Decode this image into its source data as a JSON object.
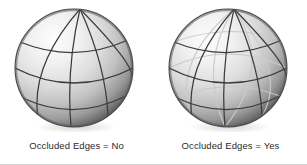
{
  "figure": {
    "background_color": "#ffffff",
    "width": 307,
    "height": 165,
    "border_color": "#d8d8d8"
  },
  "panels": [
    {
      "id": "left",
      "caption": "Occluded Edges = No",
      "sphere": {
        "show_occluded_edges": false,
        "visible_edge_color": "#3c3c3c",
        "occluded_edge_color": "#c8c8c8",
        "highlight_color": "#fcfcfc",
        "midtone_color": "#d0d0d0",
        "shadow_color": "#6e6e6e",
        "terminator_color": "#4a4a4a",
        "meridian_count": 4,
        "latitude_count": 3,
        "radius": 59,
        "center_x": 60,
        "center_y": 62
      }
    },
    {
      "id": "right",
      "caption": "Occluded Edges = Yes",
      "sphere": {
        "show_occluded_edges": true,
        "visible_edge_color": "#3c3c3c",
        "occluded_edge_color": "#c8c8c8",
        "highlight_color": "#fcfcfc",
        "midtone_color": "#d0d0d0",
        "shadow_color": "#6e6e6e",
        "terminator_color": "#4a4a4a",
        "meridian_count": 4,
        "latitude_count": 3,
        "radius": 59,
        "center_x": 60,
        "center_y": 62
      }
    }
  ]
}
